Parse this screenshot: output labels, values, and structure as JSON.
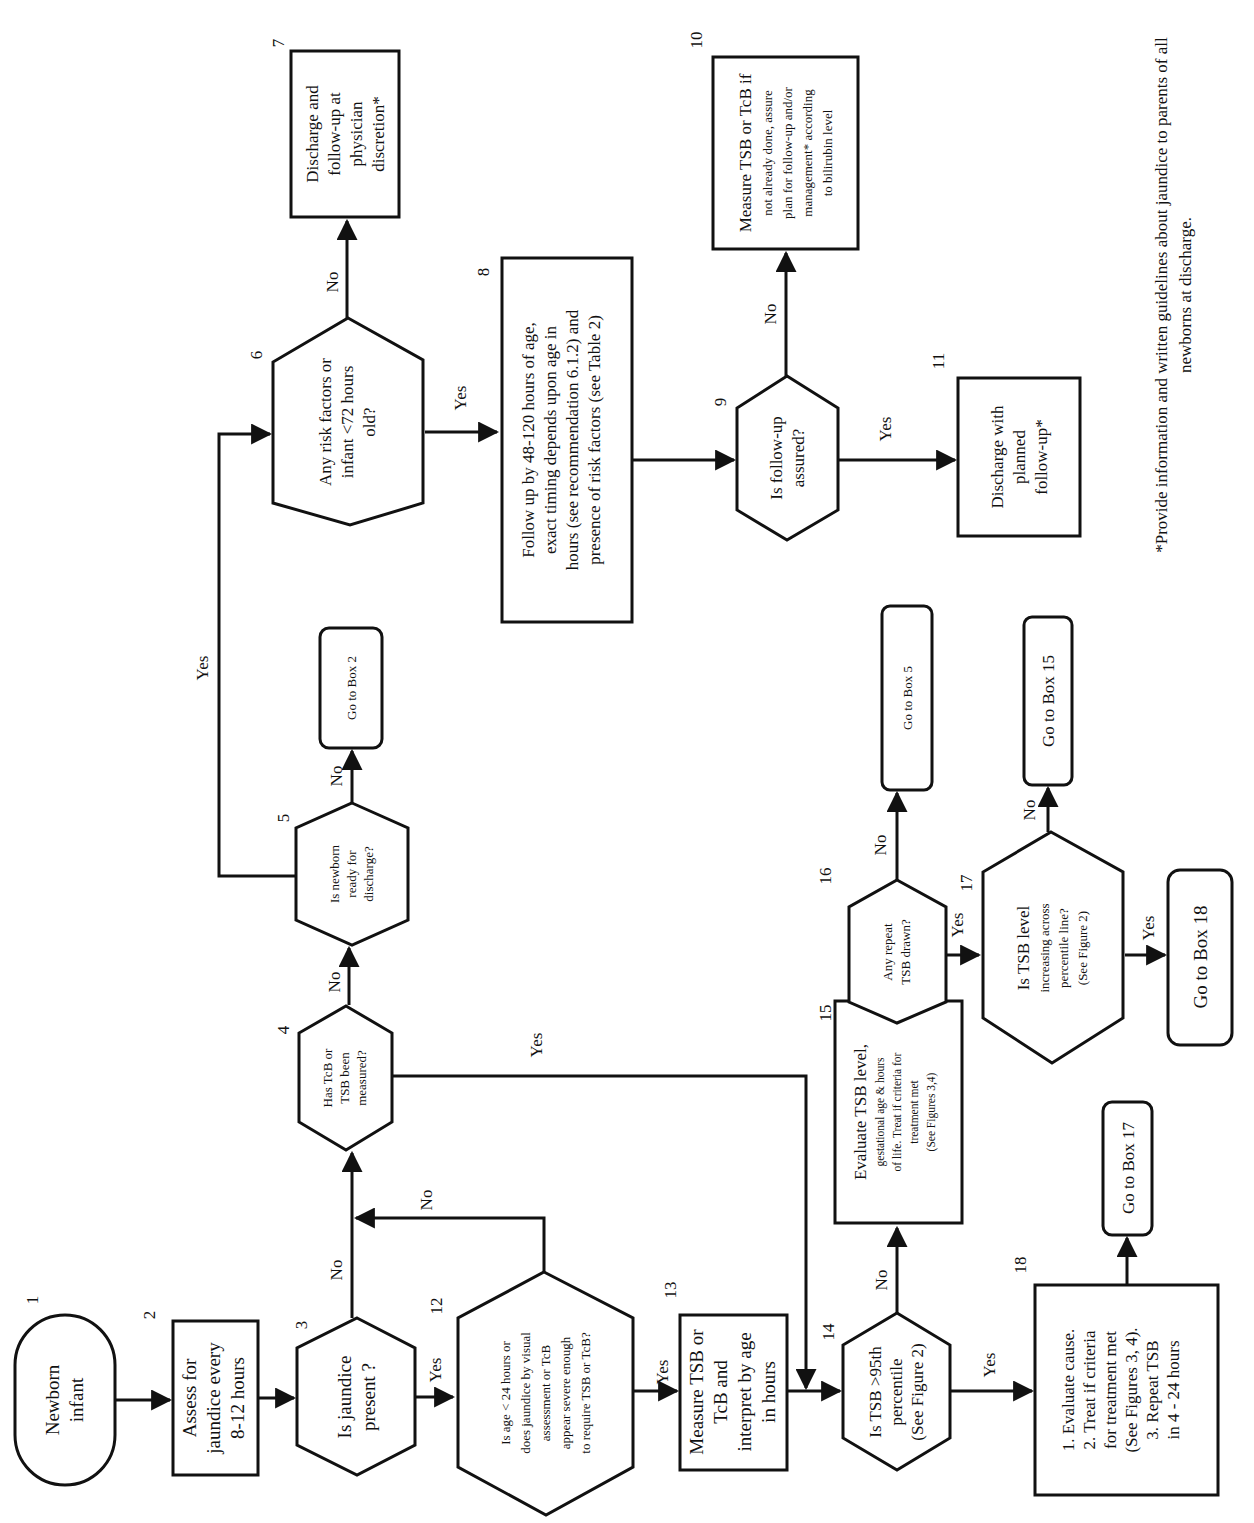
{
  "diagram": {
    "orientation": "rotated 90° counter-clockwise",
    "nodes": [
      {
        "id": "1",
        "number": "1",
        "type": "terminal",
        "lines": [
          "Newborn",
          "infant"
        ]
      },
      {
        "id": "2",
        "number": "2",
        "type": "process",
        "lines": [
          "Assess for",
          "jaundice every",
          "8-12 hours"
        ]
      },
      {
        "id": "3",
        "number": "3",
        "type": "decision",
        "lines": [
          "Is jaundice",
          "present ?"
        ]
      },
      {
        "id": "4",
        "number": "4",
        "type": "decision",
        "lines": [
          "Has TcB or",
          "TSB been",
          "measured?"
        ]
      },
      {
        "id": "5",
        "number": "5",
        "type": "decision",
        "lines": [
          "Is newborn",
          "ready for",
          "discharge?"
        ]
      },
      {
        "id": "goto2",
        "type": "connector",
        "lines": [
          "Go to Box 2"
        ]
      },
      {
        "id": "6",
        "number": "6",
        "type": "decision",
        "lines": [
          "Any risk factors or",
          "infant <72 hours",
          "old?"
        ]
      },
      {
        "id": "7",
        "number": "7",
        "type": "process",
        "lines": [
          "Discharge and",
          "follow-up at",
          "physician",
          "discretion*"
        ]
      },
      {
        "id": "8",
        "number": "8",
        "type": "process",
        "lines": [
          "Follow up by 48-120 hours of age,",
          "exact timing depends upon age in",
          "hours (see recommendation 6.1.2) and",
          "presence of risk factors (see Table 2)"
        ]
      },
      {
        "id": "9",
        "number": "9",
        "type": "decision",
        "lines": [
          "Is follow-up",
          "assured?"
        ]
      },
      {
        "id": "10",
        "number": "10",
        "type": "process",
        "lines": [
          "Measure TSB or TcB if",
          "not already done, assure",
          "plan for follow-up and/or",
          "management* according",
          "to bilirubin level"
        ]
      },
      {
        "id": "11",
        "number": "11",
        "type": "process",
        "lines": [
          "Discharge with",
          "planned",
          "follow-up*"
        ]
      },
      {
        "id": "12",
        "number": "12",
        "type": "decision",
        "lines": [
          "Is age < 24 hours or",
          "does jaundice by visual",
          "assessment or TcB",
          "appear severe enough",
          "to require TSB or TcB?"
        ]
      },
      {
        "id": "13",
        "number": "13",
        "type": "process",
        "lines": [
          "Measure TSB or",
          "TcB and",
          "interpret by age",
          "in hours"
        ]
      },
      {
        "id": "14",
        "number": "14",
        "type": "decision",
        "lines": [
          "Is TSB >95th",
          "percentile",
          "(See Figure 2)"
        ]
      },
      {
        "id": "15",
        "number": "15",
        "type": "process",
        "lines": [
          "Evaluate TSB level,",
          "gestational age & hours",
          "of life. Treat if criteria for",
          "treatment met",
          "(See Figures 3,4)"
        ]
      },
      {
        "id": "16",
        "number": "16",
        "type": "decision",
        "lines": [
          "Any repeat",
          "TSB drawn?"
        ]
      },
      {
        "id": "17",
        "number": "17",
        "type": "decision",
        "lines": [
          "Is TSB level",
          "increasing across",
          "percentile line?",
          "(See Figure 2)"
        ]
      },
      {
        "id": "goto5",
        "type": "connector",
        "lines": [
          "Go to Box 5"
        ]
      },
      {
        "id": "goto15",
        "type": "connector",
        "lines": [
          "Go to Box 15"
        ]
      },
      {
        "id": "goto18",
        "type": "connector",
        "lines": [
          "Go to Box 18"
        ]
      },
      {
        "id": "18",
        "number": "18",
        "type": "process",
        "lines": [
          "1. Evaluate cause.",
          "2. Treat if criteria",
          "for treatment met",
          "(See Figures 3, 4).",
          "3. Repeat TSB",
          "in 4 - 24 hours"
        ]
      },
      {
        "id": "goto17",
        "type": "connector",
        "lines": [
          "Go to Box 17"
        ]
      }
    ],
    "edges": [
      {
        "from": "1",
        "to": "2",
        "label": ""
      },
      {
        "from": "2",
        "to": "3",
        "label": ""
      },
      {
        "from": "3",
        "to": "12",
        "label": "Yes"
      },
      {
        "from": "3",
        "to": "4",
        "label": "No"
      },
      {
        "from": "12",
        "to": "13",
        "label": "Yes"
      },
      {
        "from": "12",
        "to": "4",
        "label": "No"
      },
      {
        "from": "4",
        "to": "5",
        "label": "No"
      },
      {
        "from": "4",
        "to": "14",
        "label": "Yes"
      },
      {
        "from": "5",
        "to": "goto2",
        "label": "No"
      },
      {
        "from": "5",
        "to": "6",
        "label": "Yes"
      },
      {
        "from": "6",
        "to": "7",
        "label": "No"
      },
      {
        "from": "6",
        "to": "8",
        "label": "Yes"
      },
      {
        "from": "8",
        "to": "9",
        "label": ""
      },
      {
        "from": "9",
        "to": "10",
        "label": "No"
      },
      {
        "from": "9",
        "to": "11",
        "label": "Yes"
      },
      {
        "from": "13",
        "to": "14",
        "label": ""
      },
      {
        "from": "14",
        "to": "15",
        "label": "No"
      },
      {
        "from": "14",
        "to": "18",
        "label": "Yes"
      },
      {
        "from": "15",
        "to": "16",
        "label": ""
      },
      {
        "from": "16",
        "to": "goto5",
        "label": "No"
      },
      {
        "from": "16",
        "to": "17",
        "label": "Yes"
      },
      {
        "from": "17",
        "to": "goto15",
        "label": "No"
      },
      {
        "from": "17",
        "to": "goto18",
        "label": "Yes"
      },
      {
        "from": "18",
        "to": "goto17",
        "label": ""
      }
    ],
    "edge_labels": {
      "yes": "Yes",
      "no": "No"
    },
    "footnote": [
      "*Provide information and written guidelines about jaundice to parents of all",
      "newborns at discharge."
    ]
  }
}
